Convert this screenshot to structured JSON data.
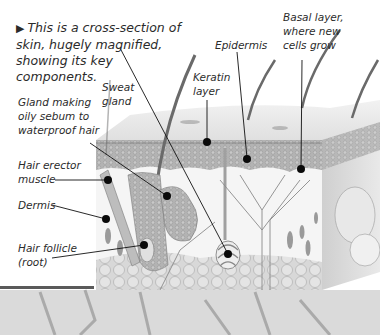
{
  "caption": {
    "marker": "▶",
    "text": "This is a cross-section of skin, hugely magnified, showing its key components."
  },
  "labels": {
    "gland_sebum": [
      "Gland making",
      "oily sebum to",
      "waterproof hair"
    ],
    "sweat_gland": [
      "Sweat",
      "gland"
    ],
    "keratin_layer": [
      "Keratin",
      "layer"
    ],
    "epidermis": [
      "Epidermis"
    ],
    "basal_layer": [
      "Basal layer,",
      "where new",
      "cells grow"
    ],
    "hair_erector": [
      "Hair erector",
      "muscle"
    ],
    "dermis": [
      "Dermis"
    ],
    "hair_follicle": [
      "Hair follicle",
      "(root)"
    ]
  },
  "colors": {
    "leader_line": "#111111",
    "dot": "#0a0a0a",
    "skin_top": "#e6e6e6",
    "epidermis_band": "#a9a9a9",
    "dermis": "#f4f4f4",
    "fat": "#c9c9c9",
    "ground": "#d4d4d4"
  }
}
